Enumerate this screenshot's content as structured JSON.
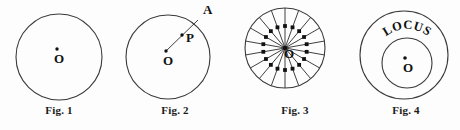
{
  "page": {
    "background": "#fdfdfd",
    "stroke_color": "#3a3a3a",
    "text_color": "#111111"
  },
  "figures": [
    {
      "id": "fig-1",
      "caption": "Fig. 1",
      "center_label": "O",
      "circle": {
        "cx": 57,
        "cy": 57,
        "r": 43
      },
      "center_dot": {
        "x": 55,
        "y": 49,
        "r": 1.7
      },
      "label_pos": {
        "x": 52,
        "y": 63
      }
    },
    {
      "id": "fig-2",
      "caption": "Fig. 2",
      "center_label": "O",
      "point_label_a": "A",
      "point_label_p": "P",
      "circle": {
        "cx": 50,
        "cy": 57,
        "r": 42
      },
      "center_dot": {
        "x": 48,
        "y": 51,
        "r": 1.7
      },
      "label_pos": {
        "x": 45,
        "y": 65
      },
      "radius": {
        "x1": 48,
        "y1": 51,
        "x2": 80,
        "y2": 20
      },
      "point_a": {
        "x": 80,
        "y": 20
      },
      "label_a_pos": {
        "x": 85,
        "y": 14
      },
      "point_p": {
        "x": 64,
        "y": 35,
        "r": 1.7
      },
      "label_p_pos": {
        "x": 68,
        "y": 42
      }
    },
    {
      "id": "fig-3",
      "caption": "Fig. 3",
      "center_label": "O",
      "circle": {
        "cx": 47,
        "cy": 48,
        "r": 40
      },
      "spoke_count": 18,
      "spoke_dot_ratio": 0.55,
      "spoke_dot_size": 1.9,
      "center_dot": {
        "x": 47,
        "y": 48,
        "r": 2.2
      },
      "label_pos": {
        "x": 46,
        "y": 58
      }
    },
    {
      "id": "fig-4",
      "caption": "Fig. 4",
      "center_label": "O",
      "locus_label": "LOCUS",
      "outer_circle": {
        "cx": 52,
        "cy": 55,
        "r": 44
      },
      "inner_circle": {
        "cx": 55,
        "cy": 63,
        "r": 25
      },
      "center_dot": {
        "x": 53,
        "y": 58,
        "r": 1.8
      },
      "label_pos": {
        "x": 51,
        "y": 72
      },
      "locus_arc_radius": 34
    }
  ],
  "panels": {
    "fig1_left": 2,
    "fig2_left": 118,
    "fig3_left": 238,
    "fig4_left": 352,
    "panel_width": 114
  }
}
